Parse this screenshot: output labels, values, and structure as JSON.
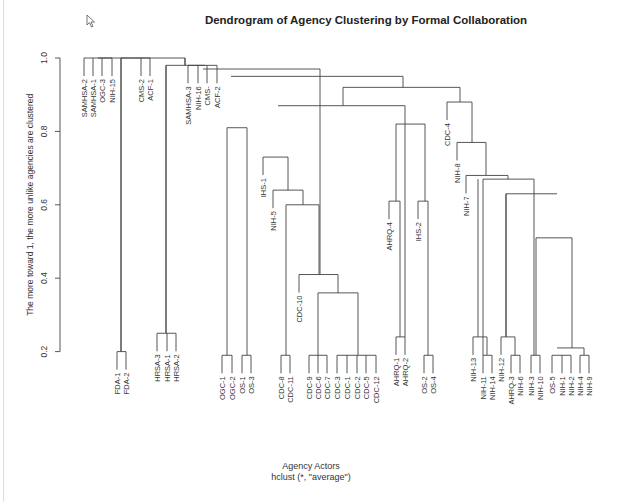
{
  "chart_data": {
    "type": "dendrogram",
    "title": "Dendrogram of Agency Clustering by Formal Collaboration",
    "xlabel": "Agency Actors",
    "sublabel": "hclust (*, \"average\")",
    "ylabel": "The more toward 1, the more unlike agencies are clustered",
    "ylim": [
      0.2,
      1.0
    ],
    "yticks": [
      "0.2",
      "0.4",
      "0.6",
      "0.8",
      "1.0"
    ],
    "method": "average",
    "leaves": [
      {
        "label": "SAMHSA-2",
        "x": 84,
        "h": 1.0
      },
      {
        "label": "SAMHSA-1",
        "x": 93,
        "h": 1.0
      },
      {
        "label": "OGC-3",
        "x": 102,
        "h": 1.0
      },
      {
        "label": "NIH-15",
        "x": 112,
        "h": 1.0
      },
      {
        "label": "FDA-1",
        "x": 117,
        "h": 0.2
      },
      {
        "label": "FDA-2",
        "x": 126,
        "h": 0.2
      },
      {
        "label": "CMS-2",
        "x": 141,
        "h": 1.0
      },
      {
        "label": "ACF-1",
        "x": 150,
        "h": 1.0
      },
      {
        "label": "HRSA-3",
        "x": 157,
        "h": 0.25
      },
      {
        "label": "HRSA-1",
        "x": 167,
        "h": 0.25
      },
      {
        "label": "HRSA-2",
        "x": 176,
        "h": 0.25
      },
      {
        "label": "SAMHSA-3",
        "x": 188,
        "h": 0.98
      },
      {
        "label": "NIH-16",
        "x": 198,
        "h": 0.98
      },
      {
        "label": "CMS-",
        "x": 207,
        "h": 0.98
      },
      {
        "label": "ACF-2",
        "x": 217,
        "h": 0.98
      },
      {
        "label": "OGC-1",
        "x": 222,
        "h": 0.19
      },
      {
        "label": "OGC-2",
        "x": 232,
        "h": 0.19
      },
      {
        "label": "OS-1",
        "x": 242,
        "h": 0.19
      },
      {
        "label": "OS-3",
        "x": 251,
        "h": 0.19
      },
      {
        "label": "IHS-1",
        "x": 263,
        "h": 0.73
      },
      {
        "label": "NIH-5",
        "x": 273,
        "h": 0.64
      },
      {
        "label": "CDC-8",
        "x": 281,
        "h": 0.19
      },
      {
        "label": "CDC-11",
        "x": 290,
        "h": 0.19
      },
      {
        "label": "CDC-10",
        "x": 299,
        "h": 0.41
      },
      {
        "label": "CDC-9",
        "x": 309,
        "h": 0.19
      },
      {
        "label": "CDC-6",
        "x": 318,
        "h": 0.19
      },
      {
        "label": "CDC-7",
        "x": 327,
        "h": 0.19
      },
      {
        "label": "CDC-3",
        "x": 337,
        "h": 0.19
      },
      {
        "label": "CDC-1",
        "x": 347,
        "h": 0.19
      },
      {
        "label": "CDC-2",
        "x": 357,
        "h": 0.19
      },
      {
        "label": "CDC-5",
        "x": 366,
        "h": 0.19
      },
      {
        "label": "CDC-12",
        "x": 376,
        "h": 0.19
      },
      {
        "label": "AHRQ-4",
        "x": 389,
        "h": 0.61
      },
      {
        "label": "AHRQ-1",
        "x": 396,
        "h": 0.24
      },
      {
        "label": "AHRQ-2",
        "x": 405,
        "h": 0.24
      },
      {
        "label": "IHS-2",
        "x": 418,
        "h": 0.61
      },
      {
        "label": "OS-2",
        "x": 424,
        "h": 0.19
      },
      {
        "label": "OS-4",
        "x": 433,
        "h": 0.19
      },
      {
        "label": "CDC-4",
        "x": 447,
        "h": 0.88
      },
      {
        "label": "NIH-8",
        "x": 457,
        "h": 0.77
      },
      {
        "label": "NIH-7",
        "x": 466,
        "h": 0.68
      },
      {
        "label": "NIH-13",
        "x": 473,
        "h": 0.24
      },
      {
        "label": "NIH-11",
        "x": 483,
        "h": 0.19
      },
      {
        "label": "NIH-14",
        "x": 492,
        "h": 0.19
      },
      {
        "label": "NIH-12",
        "x": 501,
        "h": 0.24
      },
      {
        "label": "AHRQ-3",
        "x": 511,
        "h": 0.19
      },
      {
        "label": "NIH-6",
        "x": 520,
        "h": 0.19
      },
      {
        "label": "NIH-3",
        "x": 531,
        "h": 0.19
      },
      {
        "label": "NIH-10",
        "x": 540,
        "h": 0.19
      },
      {
        "label": "OS-5",
        "x": 552,
        "h": 0.19
      },
      {
        "label": "NIH-1",
        "x": 562,
        "h": 0.19
      },
      {
        "label": "NIH-2",
        "x": 571,
        "h": 0.19
      },
      {
        "label": "NIH-4",
        "x": 580,
        "h": 0.19
      },
      {
        "label": "NIH-9",
        "x": 589,
        "h": 0.19
      }
    ],
    "merges": [
      {
        "x1": 84,
        "x2": 112,
        "h": 1.0
      },
      {
        "x1": 121,
        "x2": 150,
        "h": 1.0
      },
      {
        "x1": 98,
        "x2": 185,
        "h": 1.0
      },
      {
        "x1": 121,
        "x2": 121,
        "h": 1.0,
        "to": 0.2
      },
      {
        "x1": 117,
        "x2": 126,
        "h": 0.2
      },
      {
        "x1": 166,
        "x2": 205,
        "h": 0.98
      },
      {
        "x1": 166,
        "x2": 166,
        "h": 0.98,
        "to": 0.25
      },
      {
        "x1": 157,
        "x2": 176,
        "h": 0.25
      },
      {
        "x1": 185,
        "x2": 185,
        "h": 1.0,
        "to": 0.98
      },
      {
        "x1": 188,
        "x2": 217,
        "h": 0.98
      },
      {
        "x1": 203,
        "x2": 320,
        "h": 0.97
      },
      {
        "x1": 231,
        "x2": 403,
        "h": 0.95
      },
      {
        "x1": 222,
        "x2": 232,
        "h": 0.19
      },
      {
        "x1": 242,
        "x2": 251,
        "h": 0.19
      },
      {
        "x1": 227,
        "x2": 247,
        "h": 0.81
      },
      {
        "x1": 343,
        "x2": 460,
        "h": 0.92
      },
      {
        "x1": 278,
        "x2": 405,
        "h": 0.87
      },
      {
        "x1": 263,
        "x2": 288,
        "h": 0.73
      },
      {
        "x1": 273,
        "x2": 303,
        "h": 0.64
      },
      {
        "x1": 286,
        "x2": 319,
        "h": 0.6
      },
      {
        "x1": 281,
        "x2": 290,
        "h": 0.19
      },
      {
        "x1": 299,
        "x2": 338,
        "h": 0.41
      },
      {
        "x1": 318,
        "x2": 358,
        "h": 0.36
      },
      {
        "x1": 309,
        "x2": 327,
        "h": 0.19
      },
      {
        "x1": 337,
        "x2": 376,
        "h": 0.19
      },
      {
        "x1": 396,
        "x2": 425,
        "h": 0.82
      },
      {
        "x1": 389,
        "x2": 400,
        "h": 0.61
      },
      {
        "x1": 396,
        "x2": 405,
        "h": 0.24
      },
      {
        "x1": 418,
        "x2": 428,
        "h": 0.61
      },
      {
        "x1": 424,
        "x2": 433,
        "h": 0.19
      },
      {
        "x1": 447,
        "x2": 472,
        "h": 0.88
      },
      {
        "x1": 457,
        "x2": 486,
        "h": 0.77
      },
      {
        "x1": 466,
        "x2": 508,
        "h": 0.68
      },
      {
        "x1": 483,
        "x2": 534,
        "h": 0.67
      },
      {
        "x1": 506,
        "x2": 557,
        "h": 0.63
      },
      {
        "x1": 478,
        "x2": 478,
        "h": 0.67,
        "to": 0.24
      },
      {
        "x1": 473,
        "x2": 487,
        "h": 0.24
      },
      {
        "x1": 483,
        "x2": 492,
        "h": 0.19
      },
      {
        "x1": 506,
        "x2": 506,
        "h": 0.63,
        "to": 0.24
      },
      {
        "x1": 501,
        "x2": 515,
        "h": 0.24
      },
      {
        "x1": 511,
        "x2": 520,
        "h": 0.19
      },
      {
        "x1": 536,
        "x2": 572,
        "h": 0.51
      },
      {
        "x1": 531,
        "x2": 540,
        "h": 0.19
      },
      {
        "x1": 557,
        "x2": 584,
        "h": 0.21
      },
      {
        "x1": 552,
        "x2": 571,
        "h": 0.19
      },
      {
        "x1": 580,
        "x2": 589,
        "h": 0.19
      }
    ]
  }
}
